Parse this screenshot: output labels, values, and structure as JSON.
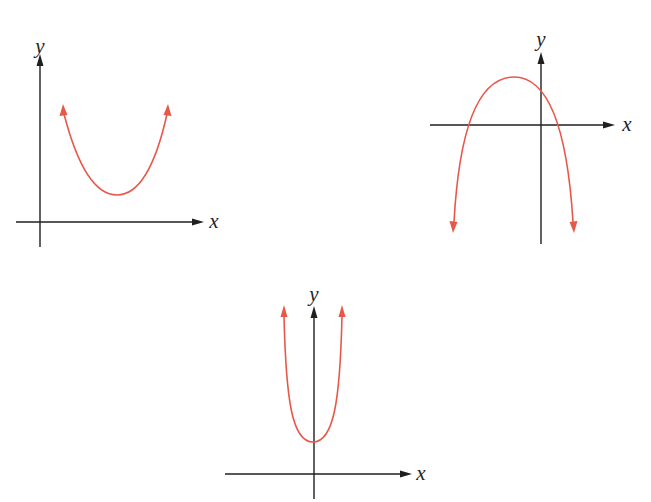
{
  "colors": {
    "axis": "#1f1f1f",
    "curve": "#e8584a",
    "background": "#ffffff"
  },
  "graphs": [
    {
      "id": "graph-upward-parabola",
      "x_label": "x",
      "y_label": "y",
      "description": "Upward-opening parabola entirely above the x-axis, vertex in the first quadrant, no real roots"
    },
    {
      "id": "graph-downward-parabola",
      "x_label": "x",
      "y_label": "y",
      "description": "Downward-opening parabola, vertex left of the y-axis above the x-axis, two real roots (one negative, one positive)"
    },
    {
      "id": "graph-narrow-parabola",
      "x_label": "x",
      "y_label": "y",
      "description": "Narrow upward-opening parabola symmetric about the y-axis, vertex on the positive y-axis, no real roots"
    }
  ]
}
